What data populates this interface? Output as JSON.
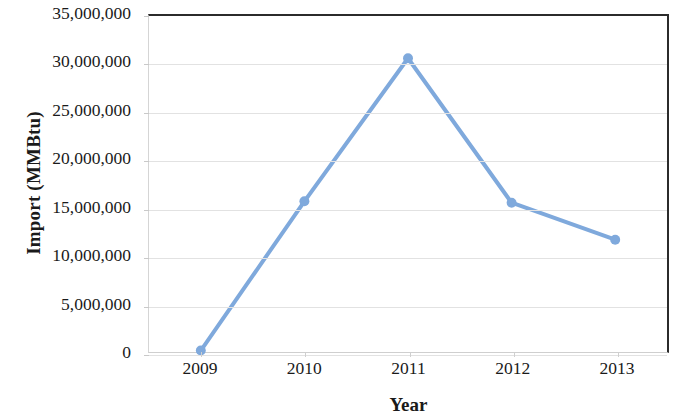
{
  "chart_data": {
    "type": "line",
    "title": "",
    "xlabel": "Year",
    "ylabel": "Import (MMBtu)",
    "categories": [
      "2009",
      "2010",
      "2011",
      "2012",
      "2013"
    ],
    "values": [
      150000,
      15700000,
      30600000,
      15550000,
      11700000
    ],
    "series": [
      {
        "name": "Import (MMBtu)",
        "values": [
          150000,
          15700000,
          30600000,
          15550000,
          11700000
        ]
      }
    ],
    "ylim": [
      0,
      35000000
    ],
    "ytick_values": [
      0,
      5000000,
      10000000,
      15000000,
      20000000,
      25000000,
      30000000,
      35000000
    ],
    "ytick_labels": [
      "0",
      "5,000,000",
      "10,000,000",
      "15,000,000",
      "20,000,000",
      "25,000,000",
      "30,000,000",
      "35,000,000"
    ],
    "grid": true,
    "legend": false,
    "legend_position": "none",
    "line_color": "#7FA9DC",
    "marker_color": "#7FA9DC",
    "marker_shape": "circle",
    "axis_frame_color": "#2b2b2b",
    "gridline_color": "#e2e2e2",
    "background_color": "#ffffff"
  }
}
